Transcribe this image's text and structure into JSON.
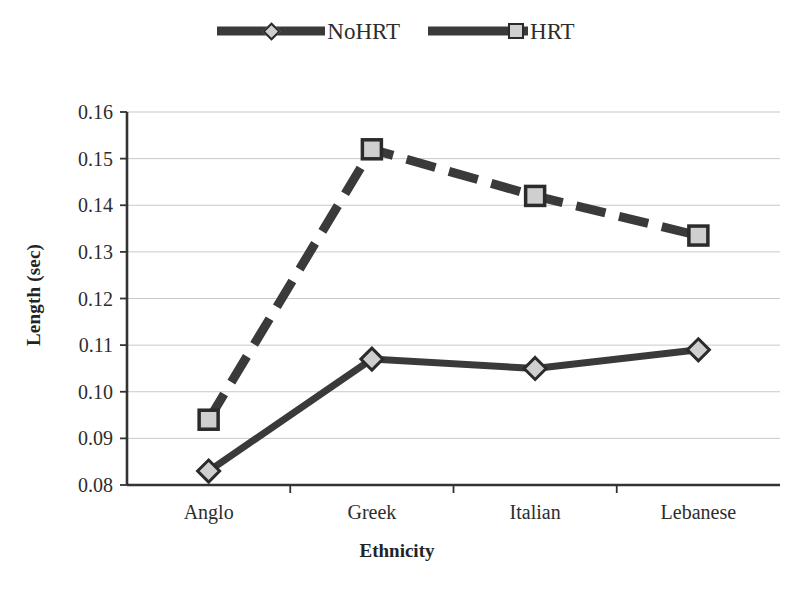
{
  "legend": {
    "position": "top-center",
    "entries": [
      {
        "label": "NoHRT",
        "marker": "diamond-marker-icon",
        "line_style": "solid"
      },
      {
        "label": "HRT",
        "marker": "square-marker-icon",
        "line_style": "dashed"
      }
    ]
  },
  "axes": {
    "x_title": "Ethnicity",
    "y_title": "Length (sec)",
    "y_ticks": [
      "0.08",
      "0.09",
      "0.10",
      "0.11",
      "0.12",
      "0.13",
      "0.14",
      "0.15",
      "0.16"
    ],
    "x_ticks": [
      "Anglo",
      "Greek",
      "Italian",
      "Lebanese"
    ]
  },
  "colors": {
    "line": "#3a3a3a",
    "marker_fill": "#cfcfcf",
    "marker_edge": "#2b2b2b",
    "gridline": "#c9c9c9",
    "axis": "#333333",
    "background": "#ffffff",
    "text": "#2d2d2d"
  },
  "chart_data": {
    "type": "line",
    "title": "",
    "xlabel": "Ethnicity",
    "ylabel": "Length (sec)",
    "categories": [
      "Anglo",
      "Greek",
      "Italian",
      "Lebanese"
    ],
    "ylim": [
      0.08,
      0.16
    ],
    "ytick_step": 0.01,
    "grid": "horizontal",
    "legend_position": "top-center",
    "series": [
      {
        "name": "NoHRT",
        "marker": "diamond",
        "line_style": "solid",
        "values": [
          0.083,
          0.107,
          0.105,
          0.109
        ]
      },
      {
        "name": "HRT",
        "marker": "square",
        "line_style": "dashed",
        "values": [
          0.094,
          0.152,
          0.142,
          0.1335
        ]
      }
    ]
  }
}
